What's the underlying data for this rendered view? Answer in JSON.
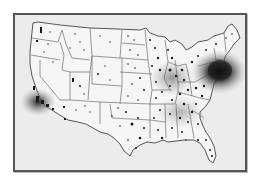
{
  "map": {
    "type": "dot density map",
    "region": "contiguous United States",
    "colors": {
      "background": "#ffffff",
      "frame_border": "#555555",
      "frame_fill": "#ececec",
      "land": "#f6f6f6",
      "state_lines": "#555555",
      "dots": "#1a1a1a",
      "density_hotspot": "#111111"
    },
    "hotspots": [
      {
        "name": "northeast-corridor",
        "intensity": "very high"
      },
      {
        "name": "california-coast",
        "intensity": "high"
      }
    ]
  }
}
